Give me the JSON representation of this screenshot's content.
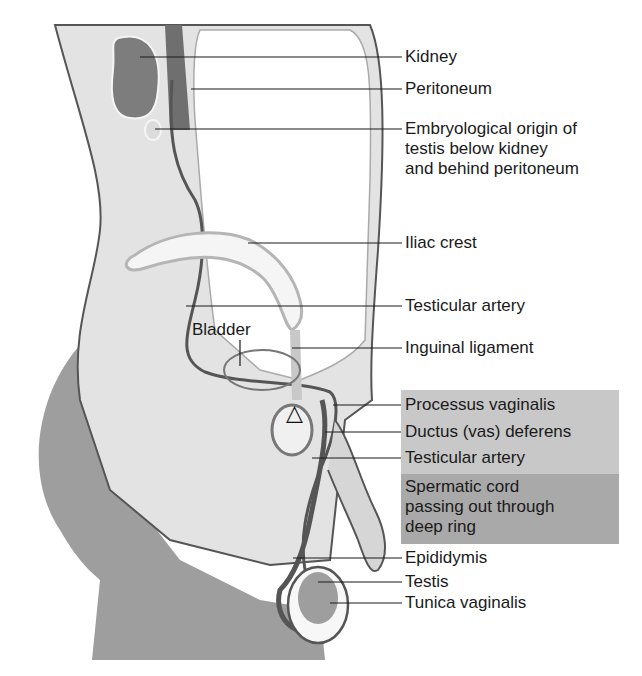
{
  "figure": {
    "colors": {
      "background": "#ffffff",
      "body_light": "#e3e3e3",
      "body_mid": "#cfcfcf",
      "body_dark": "#9e9e9e",
      "kidney": "#7d7d7d",
      "outline": "#555555",
      "leader_line": "#1a1a1a",
      "highlight_box_light": "#c8c8c8",
      "highlight_box_dark": "#a9a9a9"
    }
  },
  "labels": {
    "kidney": "Kidney",
    "peritoneum": "Peritoneum",
    "embryological_origin": "Embryological origin of\ntestis below kidney\nand behind peritoneum",
    "iliac_crest": "Iliac crest",
    "testicular_artery_upper": "Testicular artery",
    "inguinal_ligament": "Inguinal ligament",
    "processus_vaginalis": "Processus vaginalis",
    "ductus_deferens": "Ductus (vas) deferens",
    "testicular_artery_lower": "Testicular artery",
    "spermatic_cord": "Spermatic cord\npassing out through\ndeep ring",
    "epididymis": "Epididymis",
    "testis": "Testis",
    "tunica_vaginalis": "Tunica vaginalis",
    "bladder": "Bladder"
  },
  "markers": {
    "deep_ring_symbol": "△"
  }
}
